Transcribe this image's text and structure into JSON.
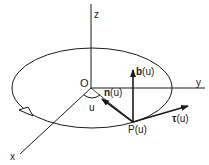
{
  "diagram": {
    "type": "3d-frenet-frame-on-circle",
    "colors": {
      "ink": "#1a1a1a",
      "background": "#ffffff"
    },
    "axes": {
      "z": {
        "label": "z"
      },
      "y": {
        "label": "y"
      },
      "x": {
        "label": "x"
      }
    },
    "origin": {
      "label": "O"
    },
    "angle": {
      "label": "u"
    },
    "point": {
      "label": "P(u)"
    },
    "vectors": {
      "binormal": {
        "symbol": "b",
        "arg": "(u)"
      },
      "normal": {
        "symbol": "n",
        "arg": "(u)"
      },
      "tangent": {
        "symbol": "τ",
        "arg": "(u)"
      }
    }
  }
}
